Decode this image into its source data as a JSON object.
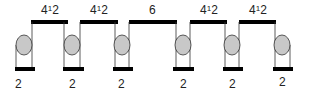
{
  "diagram": {
    "colors": {
      "bar": "#000000",
      "line": "#333333",
      "circle_fill": "#c8c8c8",
      "circle_stroke": "#333333"
    },
    "top_segments": [
      {
        "label_main": "4",
        "label_sup": "1",
        "label_tail": "2",
        "x1": 31,
        "x2": 68
      },
      {
        "label_main": "4",
        "label_sup": "1",
        "label_tail": "2",
        "x1": 80,
        "x2": 118
      },
      {
        "label_main": "6",
        "label_sup": "",
        "label_tail": "",
        "x1": 129,
        "x2": 177
      },
      {
        "label_main": "4",
        "label_sup": "1",
        "label_tail": "2",
        "x1": 190,
        "x2": 227
      },
      {
        "label_main": "4",
        "label_sup": "1",
        "label_tail": "2",
        "x1": 239,
        "x2": 276
      }
    ],
    "units": [
      {
        "label": "2",
        "cx": 24
      },
      {
        "label": "2",
        "cx": 72
      },
      {
        "label": "2",
        "cx": 122
      },
      {
        "label": "2",
        "cx": 183
      },
      {
        "label": "2",
        "cx": 232
      },
      {
        "label": "2",
        "cx": 282
      }
    ]
  }
}
